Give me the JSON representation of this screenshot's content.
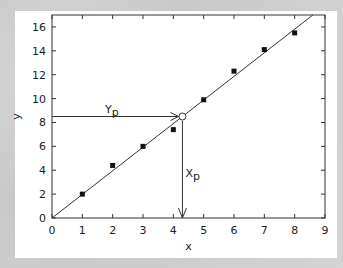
{
  "chart_data": {
    "type": "scatter",
    "title": "",
    "xlabel": "x",
    "ylabel": "y",
    "xlim": [
      0,
      9
    ],
    "ylim": [
      0,
      17
    ],
    "x_ticks": [
      0,
      1,
      2,
      3,
      4,
      5,
      6,
      7,
      8,
      9
    ],
    "y_ticks": [
      0,
      2,
      4,
      6,
      8,
      10,
      12,
      14,
      16
    ],
    "grid": false,
    "legend": null,
    "series": [
      {
        "name": "data points",
        "marker": "square",
        "x": [
          1,
          2,
          3,
          4,
          5,
          6,
          7,
          8
        ],
        "y": [
          2.0,
          4.4,
          6.0,
          7.4,
          9.9,
          12.3,
          14.1,
          15.5
        ]
      },
      {
        "name": "fit line",
        "type": "line",
        "x": [
          0,
          8.6
        ],
        "y": [
          0,
          17
        ]
      }
    ],
    "annotations": [
      {
        "text": "Yp",
        "type": "horizontal-arrow",
        "from": [
          0,
          8.5
        ],
        "to": [
          4.3,
          8.5
        ]
      },
      {
        "text": "Xp",
        "type": "vertical-arrow",
        "from": [
          4.3,
          8.5
        ],
        "to": [
          4.3,
          0
        ]
      },
      {
        "type": "open-circle",
        "at": [
          4.3,
          8.5
        ]
      }
    ]
  },
  "labels": {
    "xlabel": "x",
    "ylabel": "y",
    "yp_main": "Y",
    "yp_sub": "p",
    "xp_main": "X",
    "xp_sub": "p"
  },
  "colors": {
    "background": "#cfcfcf",
    "panel": "#ffffff",
    "axis": "#333333",
    "line": "#333333",
    "marker": "#111111"
  }
}
